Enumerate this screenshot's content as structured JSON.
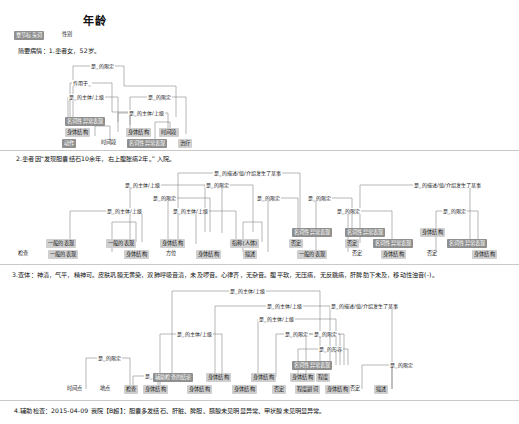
{
  "page": {
    "title": "年龄",
    "header_chips": [
      {
        "label": "章节标头词",
        "style": "dark",
        "x": 14,
        "y": 31
      },
      {
        "label": "性别",
        "style": "plain",
        "x": 62,
        "y": 31
      }
    ]
  },
  "sentences": [
    {
      "id": "s1",
      "text": "简要病情：1.患者女，52岁。",
      "x": 18,
      "y": 46
    },
    {
      "id": "s2",
      "text": "2.患者因“发现胆囊结石10余年，右上腹胀痛2年。”  入院。",
      "x": 16,
      "y": 154
    },
    {
      "id": "s3",
      "text": "3.查体：神清，气平，精神可。皮肤巩膜无黄染，双肺呼吸音清，未及啰音。心律齐，无杂音。腹平软，无压痛，无反跳痛，肝脾肋下未及，移动性浊音(-)。",
      "x": 12,
      "y": 270
    },
    {
      "id": "s4",
      "text": "4.辅助检查：2015-04-09  我院【B超】：胆囊多发结石、肝脏、脾胆、胰腺未见明显异常、甲状腺未见明显异常。",
      "x": 14,
      "y": 406
    }
  ],
  "blocks": [
    {
      "id": "block1",
      "arc_labels": [
        {
          "text": "是_的限定",
          "x": 90,
          "y": 63
        },
        {
          "text": "作用于_",
          "x": 72,
          "y": 80
        },
        {
          "text": "是_的主体/上级",
          "x": 68,
          "y": 94
        },
        {
          "text": "是_的限定",
          "x": 147,
          "y": 94
        },
        {
          "text": "是_的主体/上级",
          "x": 128,
          "y": 110
        }
      ],
      "nodes": [
        {
          "label": "名词性异常表现",
          "style": "dark",
          "x": 65,
          "y": 117
        },
        {
          "label": "身体结构",
          "style": "light",
          "x": 65,
          "y": 128
        },
        {
          "label": "身体结构",
          "style": "light",
          "x": 126,
          "y": 128
        },
        {
          "label": "时间段",
          "style": "light",
          "x": 159,
          "y": 128
        },
        {
          "label": "动作",
          "style": "dark",
          "x": 62,
          "y": 139
        },
        {
          "label": "时间段",
          "style": "plain",
          "x": 101,
          "y": 139
        },
        {
          "label": "名词性异常表现",
          "style": "dark",
          "x": 127,
          "y": 139
        },
        {
          "label": "治疗",
          "style": "light",
          "x": 178,
          "y": 139
        }
      ]
    },
    {
      "id": "block2",
      "arc_labels": [
        {
          "text": "是_的描述/值/介绍发生了某事",
          "x": 213,
          "y": 170
        },
        {
          "text": "是_的主体/上级",
          "x": 124,
          "y": 182
        },
        {
          "text": "是_的限定",
          "x": 205,
          "y": 182
        },
        {
          "text": "是_的限定",
          "x": 152,
          "y": 195
        },
        {
          "text": "是_的主体/上级",
          "x": 106,
          "y": 208
        },
        {
          "text": "是_的主体/上级",
          "x": 172,
          "y": 208
        },
        {
          "text": "是_的限定",
          "x": 256,
          "y": 195
        },
        {
          "text": "是_的限定",
          "x": 307,
          "y": 195
        },
        {
          "text": "是_的描述/值/介绍发生了某事",
          "x": 413,
          "y": 182
        },
        {
          "text": "是_的限定",
          "x": 336,
          "y": 208
        },
        {
          "text": "是_的限定",
          "x": 442,
          "y": 208
        }
      ],
      "nodes": [
        {
          "label": "名词性异常表现",
          "style": "dark",
          "x": 292,
          "y": 228
        },
        {
          "label": "名词性异常表现",
          "style": "dark",
          "x": 345,
          "y": 228
        },
        {
          "label": "身体结构",
          "style": "light",
          "x": 420,
          "y": 228
        },
        {
          "label": "一般的表现",
          "style": "light",
          "x": 46,
          "y": 239
        },
        {
          "label": "一般的表现",
          "style": "light",
          "x": 106,
          "y": 239
        },
        {
          "label": "身体结构",
          "style": "light",
          "x": 160,
          "y": 239
        },
        {
          "label": "指称(人体)",
          "style": "light",
          "x": 230,
          "y": 239
        },
        {
          "label": "否定",
          "style": "light",
          "x": 289,
          "y": 239
        },
        {
          "label": "否定",
          "style": "light",
          "x": 345,
          "y": 239
        },
        {
          "label": "名词性异常表现",
          "style": "dark",
          "x": 373,
          "y": 239
        },
        {
          "label": "名词性异常表现",
          "style": "dark",
          "x": 447,
          "y": 239
        },
        {
          "label": "检查",
          "style": "plain",
          "x": 18,
          "y": 250
        },
        {
          "label": "一般的表现",
          "style": "light",
          "x": 48,
          "y": 250
        },
        {
          "label": "身体结构",
          "style": "light",
          "x": 124,
          "y": 250
        },
        {
          "label": "方位",
          "style": "plain",
          "x": 166,
          "y": 250
        },
        {
          "label": "身体结构",
          "style": "light",
          "x": 196,
          "y": 250
        },
        {
          "label": "描述",
          "style": "light",
          "x": 243,
          "y": 250
        },
        {
          "label": "一般的表现",
          "style": "light",
          "x": 297,
          "y": 250
        },
        {
          "label": "否定",
          "style": "plain",
          "x": 352,
          "y": 250
        },
        {
          "label": "身体结构",
          "style": "light",
          "x": 381,
          "y": 250
        },
        {
          "label": "否定",
          "style": "plain",
          "x": 427,
          "y": 250
        },
        {
          "label": "身体结构",
          "style": "light",
          "x": 472,
          "y": 250
        }
      ]
    },
    {
      "id": "block3",
      "arc_labels": [
        {
          "text": "是_的主体/上级",
          "x": 229,
          "y": 288
        },
        {
          "text": "是_的主体/上级",
          "x": 266,
          "y": 303
        },
        {
          "text": "是_的描述/值/介绍发生了某事",
          "x": 330,
          "y": 303
        },
        {
          "text": "是_的主体/上级",
          "x": 258,
          "y": 316
        },
        {
          "text": "是_的限定",
          "x": 284,
          "y": 331
        },
        {
          "text": "是_的限定",
          "x": 313,
          "y": 331
        },
        {
          "text": "是_的主体/上级",
          "x": 176,
          "y": 331
        },
        {
          "text": "是_的形容",
          "x": 318,
          "y": 346
        },
        {
          "text": "是_的限定",
          "x": 97,
          "y": 355
        },
        {
          "text": "是_的限定",
          "x": 389,
          "y": 362
        },
        {
          "text": "是_的限定",
          "x": 144,
          "y": 373
        }
      ],
      "nodes": [
        {
          "label": "辅助检查的结论",
          "style": "dark",
          "x": 153,
          "y": 373
        },
        {
          "label": "名词性异常表现",
          "style": "dark",
          "x": 292,
          "y": 361
        },
        {
          "label": "身体结构",
          "style": "light",
          "x": 206,
          "y": 373
        },
        {
          "label": "身体结构",
          "style": "light",
          "x": 251,
          "y": 373
        },
        {
          "label": "身体结构",
          "style": "light",
          "x": 290,
          "y": 373
        },
        {
          "label": "程度",
          "style": "light",
          "x": 316,
          "y": 373
        },
        {
          "label": "时间点",
          "style": "plain",
          "x": 67,
          "y": 385
        },
        {
          "label": "地点",
          "style": "plain",
          "x": 100,
          "y": 385
        },
        {
          "label": "检查",
          "style": "light",
          "x": 124,
          "y": 385
        },
        {
          "label": "身体结构",
          "style": "light",
          "x": 143,
          "y": 385
        },
        {
          "label": "身体结构",
          "style": "light",
          "x": 187,
          "y": 385
        },
        {
          "label": "身体结构",
          "style": "light",
          "x": 232,
          "y": 385
        },
        {
          "label": "否定",
          "style": "light",
          "x": 272,
          "y": 385
        },
        {
          "label": "程度副词",
          "style": "light",
          "x": 295,
          "y": 385
        },
        {
          "label": "否定",
          "style": "plain",
          "x": 350,
          "y": 385
        },
        {
          "label": "身体结构",
          "style": "light",
          "x": 325,
          "y": 385
        },
        {
          "label": "描述",
          "style": "light",
          "x": 374,
          "y": 385
        }
      ]
    }
  ],
  "rules": [
    {
      "y": 150
    },
    {
      "y": 264
    },
    {
      "y": 400
    }
  ]
}
